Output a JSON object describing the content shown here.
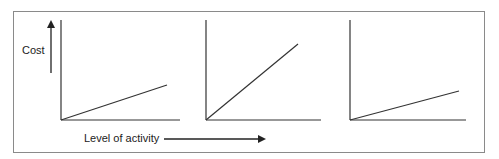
{
  "diagram": {
    "y_axis_label": "Cost",
    "x_axis_label": "Level of activity",
    "panels": [
      {
        "name": "low-slope",
        "origin": [
          61,
          120
        ],
        "y_top": 20,
        "x_end": 180,
        "line_end": [
          167,
          85
        ]
      },
      {
        "name": "steep-slope",
        "origin": [
          206,
          120
        ],
        "y_top": 20,
        "x_end": 321,
        "line_end": [
          298,
          44
        ]
      },
      {
        "name": "lowest-slope",
        "origin": [
          350,
          120
        ],
        "y_top": 20,
        "x_end": 466,
        "line_end": [
          459,
          91
        ]
      }
    ],
    "colors": {
      "line": "#333333",
      "border": "#8a8a8a"
    }
  }
}
